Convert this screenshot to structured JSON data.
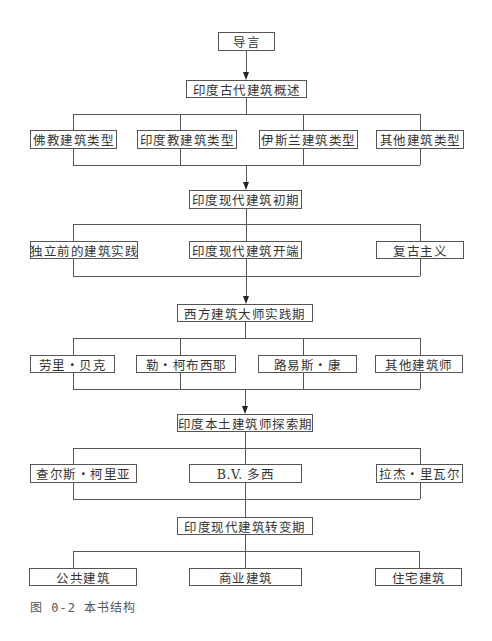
{
  "diagram": {
    "root": "导言",
    "levels": [
      {
        "title": "印度古代建筑概述",
        "children": [
          "佛教建筑类型",
          "印度教建筑类型",
          "伊斯兰建筑类型",
          "其他建筑类型"
        ]
      },
      {
        "title": "印度现代建筑初期",
        "children": [
          "独立前的建筑实践",
          "印度现代建筑开端",
          "复古主义"
        ]
      },
      {
        "title": "西方建筑大师实践期",
        "children": [
          "劳里・贝克",
          "勒・柯布西耶",
          "路易斯・康",
          "其他建筑师"
        ]
      },
      {
        "title": "印度本土建筑师探索期",
        "children": [
          "查尔斯・柯里亚",
          "B.V. 多西",
          "拉杰・里瓦尔"
        ]
      },
      {
        "title": "印度现代建筑转变期",
        "children": [
          "公共建筑",
          "商业建筑",
          "住宅建筑"
        ]
      }
    ]
  },
  "caption": "图 0-2  本书结构",
  "colors": {
    "line": "#555555",
    "arrow": "#222222",
    "text": "#333333",
    "background": "#ffffff"
  }
}
